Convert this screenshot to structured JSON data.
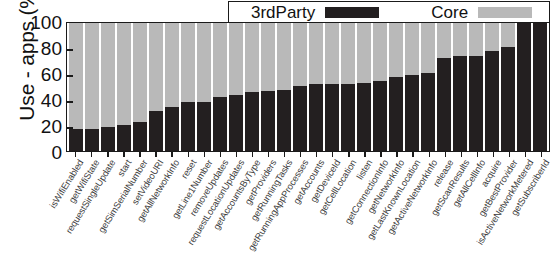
{
  "chart_data": {
    "type": "bar",
    "subtype": "stacked-bar-percent",
    "title": "",
    "xlabel": "",
    "ylabel": "Use - apps (%)",
    "ylim": [
      0,
      100
    ],
    "yticks": [
      0,
      20,
      40,
      60,
      80,
      100
    ],
    "grid": false,
    "legend_position": "top-right",
    "legend": [
      "3rdParty",
      "Core"
    ],
    "colors": {
      "3rdParty": "#231f20",
      "Core": "#b9b9b9",
      "axis": "#1a1a1a",
      "background": "#ffffff"
    },
    "categories": [
      "isWifiEnabled",
      "getWifiState",
      "requestSingleUpdate",
      "start",
      "getSimSerialNumber",
      "setVideoURI",
      "getAllNetworkInfo",
      "reset",
      "getLine1Number",
      "removeUpdates",
      "requestLocationUpdates",
      "getAccountsByType",
      "getProviders",
      "getRunningTasks",
      "getRunningAppProcesses",
      "getAccounts",
      "getDeviceId",
      "getCellLocation",
      "listen",
      "getConnectionInfo",
      "getNetworkInfo",
      "getLastKnownLocation",
      "getActiveNetworkInfo",
      "release",
      "getScanResults",
      "getAllCellInfo",
      "acquire",
      "getBestProvider",
      "isActiveNetworkMetered",
      "getSubscriberId"
    ],
    "series": [
      {
        "name": "3rdParty",
        "values": [
          17,
          17,
          19,
          20,
          23,
          31,
          34,
          38,
          38,
          42,
          44,
          46,
          47,
          48,
          51,
          52,
          52,
          52,
          53,
          55,
          58,
          59,
          61,
          73,
          74,
          74,
          78,
          81,
          100,
          100
        ]
      },
      {
        "name": "Core",
        "values": [
          83,
          83,
          81,
          80,
          77,
          69,
          66,
          62,
          62,
          58,
          56,
          54,
          53,
          52,
          49,
          48,
          48,
          48,
          47,
          45,
          42,
          41,
          39,
          27,
          26,
          26,
          22,
          19,
          0,
          0
        ]
      }
    ]
  }
}
